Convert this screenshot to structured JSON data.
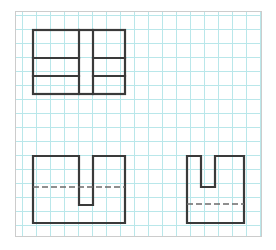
{
  "sheet": {
    "label": "engineering-graph-paper",
    "border_color": "#cccccc",
    "background_color": "#ffffff",
    "width": 247,
    "height": 226
  },
  "grid": {
    "label": "grid-squares",
    "line_color": "#b9e7ea",
    "spacing": 14,
    "origin_x": 6,
    "origin_y": 3,
    "line_width": 1
  },
  "style": {
    "visible_edge_color": "#3a3a3a",
    "visible_edge_width": 2.2,
    "hidden_edge_color": "#6b6b6b",
    "hidden_edge_width": 1.4,
    "hidden_dash": "6 3"
  },
  "chart_data": {
    "type": "diagram",
    "subtitle": "Three views drawn on square grid paper",
    "views": [
      {
        "name": "top-view",
        "label": "Top View",
        "position": "upper-left",
        "outline": {
          "x": 32,
          "y": 29,
          "width": 92,
          "height": 64
        },
        "internal_lines": [
          {
            "name": "vertical-slot-left",
            "orientation": "vertical",
            "x": 78,
            "y1": 29,
            "y2": 93
          },
          {
            "name": "vertical-slot-right",
            "orientation": "vertical",
            "x": 92,
            "y1": 29,
            "y2": 93
          },
          {
            "name": "horizontal-upper-left",
            "orientation": "horizontal",
            "y": 57,
            "x1": 32,
            "x2": 78
          },
          {
            "name": "horizontal-lower-left",
            "orientation": "horizontal",
            "y": 75,
            "x1": 32,
            "x2": 78
          },
          {
            "name": "horizontal-upper-right",
            "orientation": "horizontal",
            "y": 57,
            "x1": 92,
            "x2": 124
          },
          {
            "name": "horizontal-lower-right",
            "orientation": "horizontal",
            "y": 75,
            "x1": 92,
            "x2": 124
          }
        ],
        "hidden_lines": []
      },
      {
        "name": "front-view",
        "label": "Front View",
        "position": "lower-left",
        "profile_points": "32,155 78,155 78,204 92,204 92,155 124,155 124,222 32,222",
        "slot": {
          "left": 78,
          "right": 92,
          "top": 155,
          "bottom": 204,
          "width": 14,
          "depth": 49
        },
        "bounds": {
          "x": 32,
          "y": 155,
          "width": 92,
          "height": 67
        },
        "hidden_lines": [
          {
            "name": "hidden-step-line",
            "orientation": "horizontal",
            "y": 186,
            "x1": 32,
            "x2": 124
          }
        ]
      },
      {
        "name": "side-view",
        "label": "Right Side View",
        "position": "lower-right",
        "profile_points": "186,155 200,155 200,186 214,186 214,155 243,155 243,222 186,222",
        "slot": {
          "left": 200,
          "right": 214,
          "top": 155,
          "bottom": 186,
          "width": 14,
          "depth": 31
        },
        "bounds": {
          "x": 186,
          "y": 155,
          "width": 57,
          "height": 67
        },
        "hidden_lines": [
          {
            "name": "hidden-step-line",
            "orientation": "horizontal",
            "y": 203,
            "x1": 186,
            "x2": 243
          }
        ]
      }
    ],
    "legend": [
      {
        "name": "visible-edge",
        "label": "Visible edge (solid thick)",
        "color": "#3a3a3a"
      },
      {
        "name": "hidden-edge",
        "label": "Hidden edge (dashed)",
        "color": "#6b6b6b"
      },
      {
        "name": "grid-line",
        "label": "Grid square",
        "color": "#b9e7ea"
      }
    ]
  }
}
